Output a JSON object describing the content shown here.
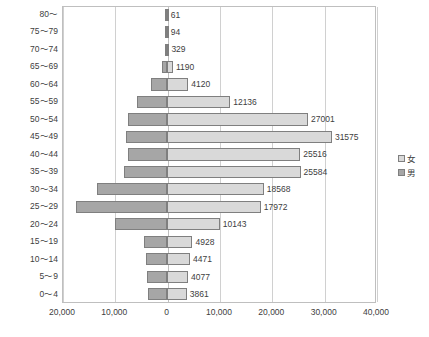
{
  "chart_data": {
    "type": "bar",
    "subtype": "population-pyramid",
    "title": "",
    "xlabel": "",
    "ylabel": "",
    "orientation": "horizontal",
    "grid": true,
    "legend_position": "right",
    "xlim": [
      -20000,
      40000
    ],
    "xticks": [
      -20000,
      -10000,
      0,
      10000,
      20000,
      30000,
      40000
    ],
    "xtick_labels": [
      "20,000",
      "10,000",
      "0",
      "10,000",
      "20,000",
      "30,000",
      "40,000"
    ],
    "categories": [
      "80～",
      "75～79",
      "70～74",
      "65～69",
      "60～64",
      "55～59",
      "50～54",
      "45～49",
      "40～44",
      "35～39",
      "30～34",
      "25～29",
      "20～24",
      "15～19",
      "10～14",
      "5～9",
      "0～4"
    ],
    "series": [
      {
        "name": "女",
        "side": "right",
        "color": "#d9d9d9",
        "values": [
          61,
          94,
          329,
          1190,
          4120,
          12136,
          27001,
          31575,
          25516,
          25584,
          18568,
          17972,
          10143,
          4928,
          4471,
          4077,
          3861
        ],
        "labels": [
          "61",
          "94",
          "329",
          "1190",
          "4120",
          "12136",
          "27001",
          "31575",
          "25516",
          "25584",
          "18568",
          "17972",
          "10143",
          "4928",
          "4471",
          "4077",
          "3861"
        ]
      },
      {
        "name": "男",
        "side": "left",
        "color": "#a6a6a6",
        "values": [
          40,
          60,
          230,
          900,
          3050,
          5700,
          7400,
          7700,
          7300,
          8100,
          13400,
          17400,
          9900,
          4300,
          4000,
          3700,
          3600
        ],
        "labels": [
          "",
          "",
          "",
          "",
          "",
          "",
          "",
          "",
          "",
          "",
          "",
          "",
          "",
          "",
          "",
          "",
          ""
        ]
      }
    ]
  },
  "legend": {
    "items": [
      {
        "label": "女",
        "swatch": "female"
      },
      {
        "label": "男",
        "swatch": "male"
      }
    ]
  },
  "caption": {
    "text": ""
  }
}
